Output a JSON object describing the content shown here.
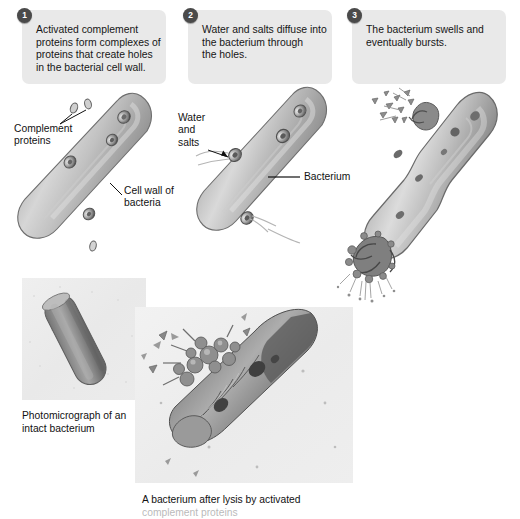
{
  "figure": {
    "title_alt": "Complement-mediated lysis of a bacterium",
    "background_color": "#ffffff",
    "callout_bg_color": "#e9e9e9",
    "badge_color": "#4a4a4a",
    "bacterium_color": "#9a9a9a",
    "label_text_color": "#121212"
  },
  "steps": [
    {
      "number": "1",
      "text": "Activated complement\nproteins form complexes of\nproteins that create holes\nin the bacterial cell wall."
    },
    {
      "number": "2",
      "text": "Water and salts diffuse into\nthe bacterium through\nthe holes."
    },
    {
      "number": "3",
      "text": "The bacterium swells and\neventually bursts."
    }
  ],
  "labels": {
    "complement_proteins": "Complement\nproteins",
    "cell_wall": "Cell wall of\nbacteria",
    "water_and_salts": "Water\nand\nsalts",
    "bacterium": "Bacterium"
  },
  "photos": [
    {
      "name": "intact-bacterium",
      "caption": "Photomicrograph of an\nintact bacterium"
    },
    {
      "name": "lysed-bacterium",
      "caption": "A bacterium after lysis by activated",
      "caption_clipped_line": "complement proteins"
    }
  ]
}
